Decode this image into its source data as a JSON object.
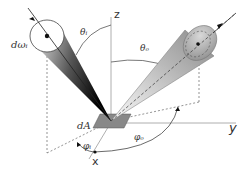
{
  "diagram": {
    "axes": {
      "z": "z",
      "y": "y",
      "x": "x"
    },
    "labels": {
      "theta_i": "θᵢ",
      "theta_o": "θₒ",
      "d_omega_i": "dωᵢ",
      "dA": "dA",
      "phi_i": "φᵢ",
      "phi_o": "φₒ"
    },
    "colors": {
      "line": "#555555",
      "axis": "#9a9a9a",
      "patch": "#888888",
      "cone_dark": "#111111",
      "cone_light": "#f2f2f2"
    }
  }
}
